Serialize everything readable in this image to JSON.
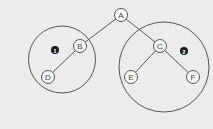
{
  "diagram": {
    "type": "tree",
    "nodes": [
      {
        "id": "A",
        "label": "A",
        "x": 121,
        "y": 15
      },
      {
        "id": "B",
        "label": "B",
        "x": 80,
        "y": 46
      },
      {
        "id": "C",
        "label": "C",
        "x": 160,
        "y": 46
      },
      {
        "id": "D",
        "label": "D",
        "x": 48,
        "y": 77
      },
      {
        "id": "E",
        "label": "E",
        "x": 131,
        "y": 77
      },
      {
        "id": "F",
        "label": "F",
        "x": 193,
        "y": 77
      }
    ],
    "edges": [
      {
        "from": "A",
        "to": "B"
      },
      {
        "from": "A",
        "to": "C"
      },
      {
        "from": "B",
        "to": "D"
      },
      {
        "from": "C",
        "to": "E"
      },
      {
        "from": "C",
        "to": "F"
      }
    ],
    "groups": [
      {
        "id": "group-1",
        "badge": "1",
        "cx": 62,
        "cy": 59.5,
        "r": 33.5,
        "badge_x": 55,
        "badge_y": 50,
        "members": [
          "B",
          "D"
        ]
      },
      {
        "id": "group-2",
        "badge": "2",
        "cx": 164,
        "cy": 67,
        "r": 45,
        "badge_x": 184,
        "badge_y": 51,
        "members": [
          "C",
          "E",
          "F"
        ]
      }
    ],
    "colors": {
      "background": "#ececec",
      "stroke": "#555555",
      "node_fill": "#fafafa",
      "badge_fill": "#1a1a1a"
    }
  }
}
